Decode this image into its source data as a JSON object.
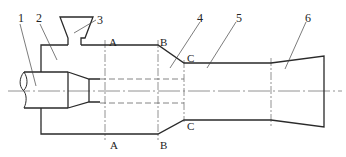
{
  "diagram": {
    "type": "ejector / venturi schematic cross-section",
    "part_labels": [
      {
        "id": "1",
        "text": "1",
        "x": 14,
        "y": 14
      },
      {
        "id": "2",
        "text": "2",
        "x": 36,
        "y": 14
      },
      {
        "id": "3",
        "text": "3",
        "x": 97,
        "y": 14
      },
      {
        "id": "4",
        "text": "4",
        "x": 197,
        "y": 13
      },
      {
        "id": "5",
        "text": "5",
        "x": 235,
        "y": 13
      },
      {
        "id": "6",
        "text": "6",
        "x": 303,
        "y": 13
      }
    ],
    "section_labels": {
      "A_top": "A",
      "A_bottom": "A",
      "B_top": "B",
      "B_bottom": "B",
      "C_top": "C",
      "C_bottom": "C"
    },
    "colors": {
      "line": "#2a2a2a",
      "thin": "#555555",
      "background": "#ffffff"
    }
  }
}
